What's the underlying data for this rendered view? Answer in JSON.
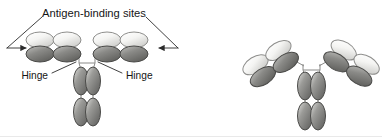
{
  "figure": {
    "background_color": "#ffffff",
    "width": 382,
    "height": 137
  },
  "labels": {
    "antigen_binding_sites": "Antigen-binding sites",
    "hinge_left": "Hinge",
    "hinge_right": "Hinge"
  },
  "colors": {
    "light_domain_fill": "#f2f2f0",
    "light_domain_edge": "#8e8e8c",
    "dark_domain_fill": "#7d7d7b",
    "dark_domain_edge": "#4a4a48",
    "stem_domain_fill": "#8b8b89",
    "stem_domain_edge": "#4a4a48",
    "connector_line": "#8a8a88",
    "leader_line": "#2b2b2b",
    "text": "#151515"
  },
  "diagrams": [
    {
      "name": "flat-arm-antibody",
      "description": "Antibody drawn with horizontal Fab arms and vertical Fc stem, annotated with antigen-binding sites and hinge labels",
      "annotated": true,
      "arm_tilt_degrees": 0,
      "arms": [
        {
          "side": "left",
          "domains": [
            {
              "chain": "light",
              "region": "variable",
              "shade": "light"
            },
            {
              "chain": "light",
              "region": "constant",
              "shade": "light"
            },
            {
              "chain": "heavy",
              "region": "variable",
              "shade": "dark"
            },
            {
              "chain": "heavy",
              "region": "constant",
              "shade": "dark"
            }
          ]
        },
        {
          "side": "right",
          "domains": [
            {
              "chain": "light",
              "region": "variable",
              "shade": "light"
            },
            {
              "chain": "light",
              "region": "constant",
              "shade": "light"
            },
            {
              "chain": "heavy",
              "region": "variable",
              "shade": "dark"
            },
            {
              "chain": "heavy",
              "region": "constant",
              "shade": "dark"
            }
          ]
        }
      ],
      "stem": {
        "name": "fc-region",
        "rows": 2,
        "columns": 2,
        "domain_count": 4,
        "shade": "medium"
      }
    },
    {
      "name": "y-shaped-antibody",
      "description": "Antibody drawn in classic Y shape with Fab arms tilted upward and vertical Fc stem, unlabelled",
      "annotated": false,
      "arm_tilt_degrees": 32,
      "arms": [
        {
          "side": "left",
          "domains": [
            {
              "chain": "light",
              "region": "variable",
              "shade": "light"
            },
            {
              "chain": "light",
              "region": "constant",
              "shade": "light"
            },
            {
              "chain": "heavy",
              "region": "variable",
              "shade": "dark"
            },
            {
              "chain": "heavy",
              "region": "constant",
              "shade": "dark"
            }
          ]
        },
        {
          "side": "right",
          "domains": [
            {
              "chain": "light",
              "region": "variable",
              "shade": "light"
            },
            {
              "chain": "light",
              "region": "constant",
              "shade": "light"
            },
            {
              "chain": "heavy",
              "region": "variable",
              "shade": "dark"
            },
            {
              "chain": "heavy",
              "region": "constant",
              "shade": "dark"
            }
          ]
        }
      ],
      "stem": {
        "name": "fc-region",
        "rows": 2,
        "columns": 2,
        "domain_count": 4,
        "shade": "medium"
      }
    }
  ]
}
